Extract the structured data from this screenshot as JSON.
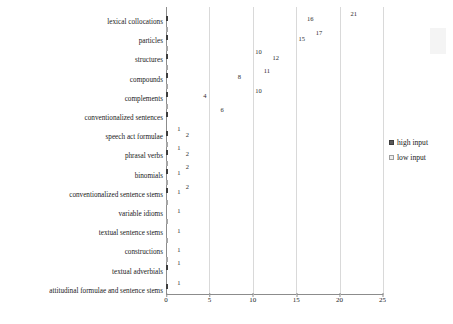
{
  "chart_data": {
    "type": "bar",
    "orientation": "horizontal",
    "title": "",
    "xlabel": "",
    "ylabel": "",
    "xlim": [
      0,
      25
    ],
    "xticks": [
      0,
      5,
      10,
      15,
      20,
      25
    ],
    "grid": true,
    "legend_position": "right",
    "categories": [
      "lexical collocations",
      "particles",
      "structures",
      "compounds",
      "complements",
      "conventionalized sentences",
      "speech act formulae",
      "phrasal verbs",
      "binomials",
      "conventionalized sentence stems",
      "variable idioms",
      "textual sentence stems",
      "constructions",
      "textual adverbials",
      "attitudinal formulae and sentence stems"
    ],
    "series": [
      {
        "name": "high input",
        "color": "#595959",
        "values": [
          21,
          17,
          10,
          11,
          10,
          6,
          1,
          1,
          2,
          2,
          null,
          null,
          null,
          1,
          1
        ]
      },
      {
        "name": "low input",
        "color": "#d4d4d4",
        "values": [
          16,
          15,
          12,
          8,
          4,
          null,
          2,
          2,
          1,
          1,
          1,
          1,
          1,
          null,
          null
        ]
      }
    ]
  },
  "legend": {
    "items": [
      {
        "label": "high input"
      },
      {
        "label": "low input"
      }
    ]
  }
}
